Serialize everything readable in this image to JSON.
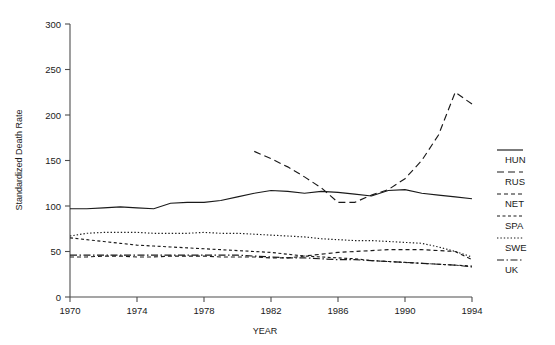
{
  "chart_data": {
    "type": "line",
    "title": "",
    "xlabel": "YEAR",
    "ylabel": "Standardized Death Rate",
    "xlim": [
      1970,
      1994
    ],
    "ylim": [
      0,
      300
    ],
    "xticks": [
      1970,
      1974,
      1978,
      1982,
      1986,
      1990,
      1994
    ],
    "yticks": [
      0,
      50,
      100,
      150,
      200,
      250,
      300
    ],
    "xtick_labels": [
      "1970",
      "1974",
      "1978",
      "1982",
      "1986",
      "1990",
      "1994"
    ],
    "ytick_labels": [
      "0",
      "50",
      "100",
      "150",
      "200",
      "250",
      "300"
    ],
    "grid": false,
    "legend_position": "right",
    "x": [
      1970,
      1971,
      1972,
      1973,
      1974,
      1975,
      1976,
      1977,
      1978,
      1979,
      1980,
      1981,
      1982,
      1983,
      1984,
      1985,
      1986,
      1987,
      1988,
      1989,
      1990,
      1991,
      1992,
      1993,
      1994
    ],
    "series": [
      {
        "name": "HUN",
        "label": "HUN",
        "style": "solid",
        "x": [
          1970,
          1971,
          1972,
          1973,
          1974,
          1975,
          1976,
          1977,
          1978,
          1979,
          1980,
          1981,
          1982,
          1983,
          1984,
          1985,
          1986,
          1987,
          1988,
          1989,
          1990,
          1991,
          1992,
          1993,
          1994
        ],
        "values": [
          97,
          97,
          98,
          99,
          98,
          97,
          103,
          104,
          104,
          106,
          110,
          114,
          117,
          116,
          114,
          116,
          115,
          113,
          111,
          117,
          118,
          114,
          112,
          110,
          108
        ]
      },
      {
        "name": "RUS",
        "label": "RUS",
        "style": "dashed-long",
        "x": [
          1981,
          1982,
          1983,
          1984,
          1985,
          1986,
          1987,
          1988,
          1989,
          1990,
          1991,
          1992,
          1993,
          1994
        ],
        "values": [
          160,
          152,
          143,
          132,
          120,
          104,
          104,
          112,
          118,
          130,
          150,
          178,
          225,
          212
        ]
      },
      {
        "name": "NET",
        "label": "NET",
        "style": "dashed-short",
        "x": [
          1970,
          1971,
          1972,
          1973,
          1974,
          1975,
          1976,
          1977,
          1978,
          1979,
          1980,
          1981,
          1982,
          1983,
          1984,
          1985,
          1986,
          1987,
          1988,
          1989,
          1990,
          1991,
          1992,
          1993,
          1994
        ],
        "values": [
          44,
          44,
          45,
          45,
          44,
          44,
          45,
          45,
          45,
          44,
          44,
          44,
          43,
          43,
          45,
          47,
          49,
          50,
          51,
          52,
          52,
          52,
          51,
          50,
          41
        ]
      },
      {
        "name": "SPA",
        "label": "SPA",
        "style": "dotted-dash",
        "x": [
          1970,
          1971,
          1972,
          1973,
          1974,
          1975,
          1976,
          1977,
          1978,
          1979,
          1980,
          1981,
          1982,
          1983,
          1984,
          1985,
          1986,
          1987,
          1988,
          1989,
          1990,
          1991,
          1992,
          1993,
          1994
        ],
        "values": [
          65,
          63,
          61,
          59,
          57,
          56,
          55,
          54,
          53,
          52,
          51,
          50,
          49,
          47,
          45,
          44,
          43,
          42,
          40,
          39,
          38,
          37,
          36,
          35,
          34
        ]
      },
      {
        "name": "SWE",
        "label": "SWE",
        "style": "dotted-fine",
        "x": [
          1970,
          1971,
          1972,
          1973,
          1974,
          1975,
          1976,
          1977,
          1978,
          1979,
          1980,
          1981,
          1982,
          1983,
          1984,
          1985,
          1986,
          1987,
          1988,
          1989,
          1990,
          1991,
          1992,
          1993,
          1994
        ],
        "values": [
          67,
          70,
          71,
          71,
          71,
          70,
          70,
          70,
          71,
          70,
          70,
          69,
          68,
          67,
          66,
          64,
          63,
          62,
          62,
          61,
          60,
          59,
          55,
          50,
          44
        ]
      },
      {
        "name": "UK",
        "label": "UK",
        "style": "dash-dot",
        "x": [
          1970,
          1971,
          1972,
          1973,
          1974,
          1975,
          1976,
          1977,
          1978,
          1979,
          1980,
          1981,
          1982,
          1983,
          1984,
          1985,
          1986,
          1987,
          1988,
          1989,
          1990,
          1991,
          1992,
          1993,
          1994
        ],
        "values": [
          46,
          46,
          46,
          46,
          46,
          46,
          46,
          46,
          46,
          46,
          46,
          45,
          44,
          43,
          43,
          42,
          41,
          41,
          40,
          39,
          38,
          37,
          36,
          35,
          33
        ]
      }
    ]
  },
  "legend": {
    "entries": [
      {
        "label": "HUN",
        "style": "solid"
      },
      {
        "label": "RUS",
        "style": "dashed-long"
      },
      {
        "label": "NET",
        "style": "dashed-short"
      },
      {
        "label": "SPA",
        "style": "dotted-dash"
      },
      {
        "label": "SWE",
        "style": "dotted-fine"
      },
      {
        "label": "UK",
        "style": "dash-dot"
      }
    ]
  },
  "colors": {
    "ink": "#1a1a1a",
    "axis": "#4d4d4d",
    "background": "#ffffff"
  }
}
